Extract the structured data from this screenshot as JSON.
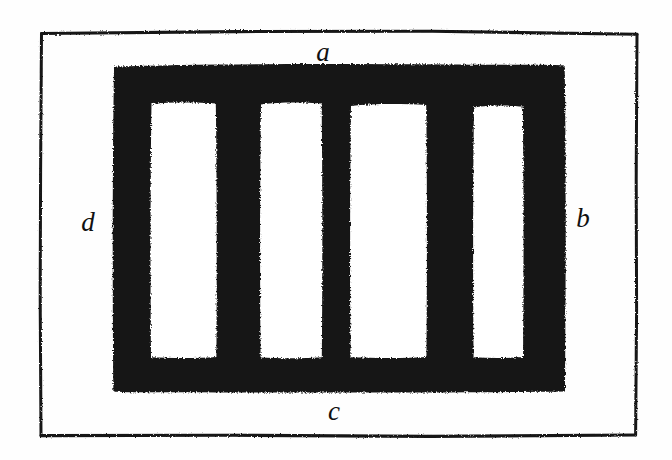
{
  "figure": {
    "kind": "hand-drawn-diagram",
    "background_color": "#fefefe",
    "ink_color": "#111111",
    "canvas": {
      "width": 672,
      "height": 460
    },
    "frame": {
      "name": "outer-rectangle-border",
      "stroke_color": "#1a1a1a",
      "stroke_width": 3,
      "bounds": {
        "left": 40,
        "top": 31,
        "right": 637,
        "bottom": 436
      }
    },
    "comb": {
      "name": "black-comb-block",
      "fill_color": "#141414",
      "bounds": {
        "left": 113,
        "top": 64,
        "right": 565,
        "bottom": 393
      },
      "slots": [
        {
          "left": 150,
          "top": 102,
          "right": 217,
          "bottom": 358
        },
        {
          "left": 260,
          "top": 102,
          "right": 322,
          "bottom": 358
        },
        {
          "left": 350,
          "top": 104,
          "right": 427,
          "bottom": 358
        },
        {
          "left": 473,
          "top": 106,
          "right": 523,
          "bottom": 358
        }
      ]
    },
    "labels": [
      {
        "id": "a",
        "text": "a",
        "side": "top",
        "x": 323,
        "y": 52
      },
      {
        "id": "b",
        "text": "b",
        "side": "right",
        "x": 583,
        "y": 218
      },
      {
        "id": "c",
        "text": "c",
        "side": "bottom",
        "x": 334,
        "y": 411
      },
      {
        "id": "d",
        "text": "d",
        "side": "left",
        "x": 88,
        "y": 222
      }
    ]
  }
}
